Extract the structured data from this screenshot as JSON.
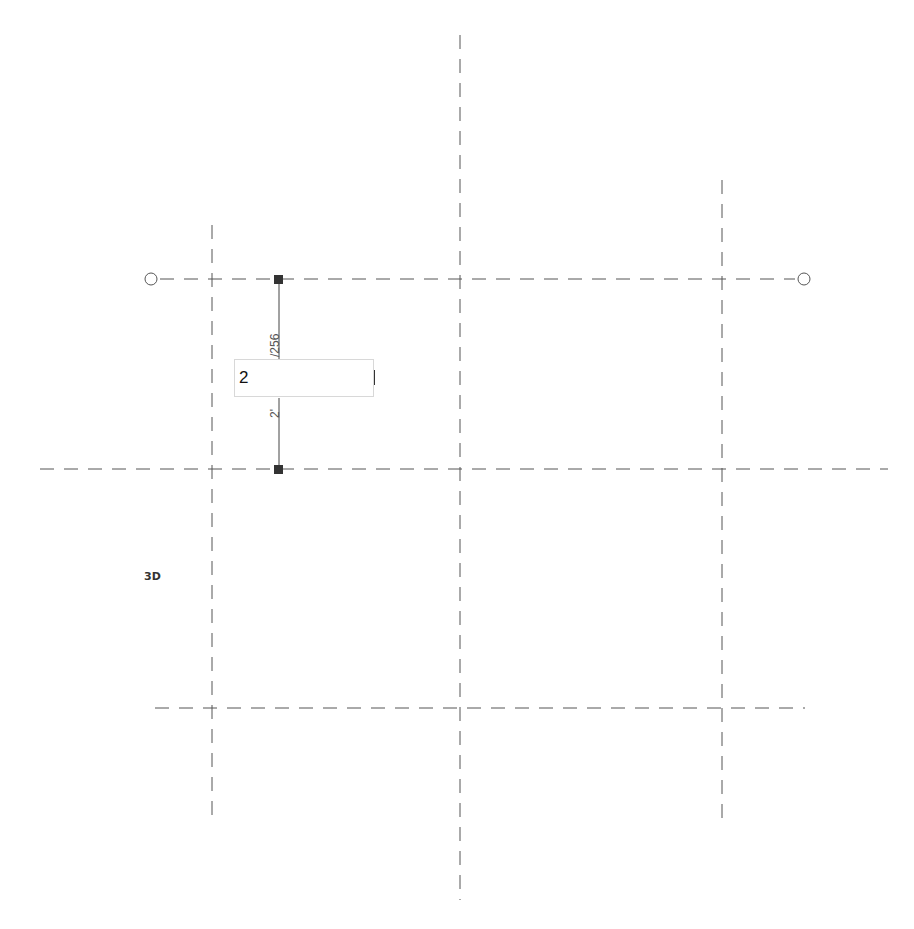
{
  "viewport": {
    "label_3d": "3D"
  },
  "grid": {
    "vertical_lines": [
      {
        "name": "grid-line-v1",
        "x": 212,
        "y1": 225,
        "y2": 820
      },
      {
        "name": "grid-line-v2",
        "x": 460,
        "y1": 35,
        "y2": 900
      },
      {
        "name": "grid-line-v3",
        "x": 722,
        "y1": 180,
        "y2": 828
      }
    ],
    "horizontal_lines": [
      {
        "name": "grid-line-h1",
        "y": 279,
        "x1": 160,
        "x2": 795
      },
      {
        "name": "grid-line-h2",
        "y": 469,
        "x1": 40,
        "x2": 888
      },
      {
        "name": "grid-line-h3",
        "y": 708,
        "x1": 155,
        "x2": 805
      }
    ],
    "bubbles": [
      {
        "name": "grid-bubble-left",
        "cx": 151,
        "cy": 279
      },
      {
        "name": "grid-bubble-right",
        "cx": 804,
        "cy": 279
      }
    ],
    "line_color": "#555555"
  },
  "dimension": {
    "x": 279,
    "y_top": 279,
    "y_bottom": 469,
    "upper_text": "/256",
    "lower_text": "2'",
    "input_value": "2",
    "line_color": "#444444"
  }
}
